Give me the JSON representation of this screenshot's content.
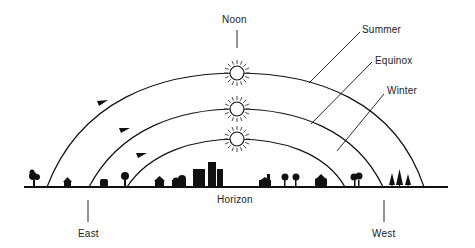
{
  "diagram": {
    "type": "sun-path",
    "labels": {
      "noon": "Noon",
      "summer": "Summer",
      "equinox": "Equinox",
      "winter": "Winter",
      "horizon": "Horizon",
      "east": "East",
      "west": "West"
    },
    "paths": [
      {
        "name": "Summer",
        "rise_x": 47,
        "set_x": 424,
        "noon_y": 73
      },
      {
        "name": "Equinox",
        "rise_x": 89,
        "set_x": 383,
        "noon_y": 109
      },
      {
        "name": "Winter",
        "rise_x": 127,
        "set_x": 345,
        "noon_y": 139
      }
    ],
    "colors": {
      "ink": "#111111",
      "background": "#ffffff"
    }
  }
}
